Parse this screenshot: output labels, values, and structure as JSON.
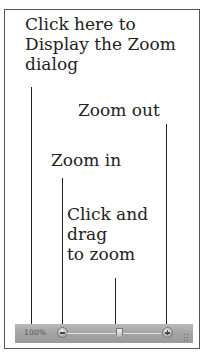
{
  "callouts": {
    "zoom_dialog": "Click here to\nDisplay the Zoom\ndialog",
    "zoom_out": "Zoom out",
    "zoom_in": "Zoom in",
    "slider": "Click and\ndrag\nto zoom"
  },
  "statusbar": {
    "zoom_level": "100%",
    "zoom_out_icon": "minus-circle-icon",
    "zoom_in_icon": "plus-circle-icon",
    "slider_position_percent": 50
  }
}
